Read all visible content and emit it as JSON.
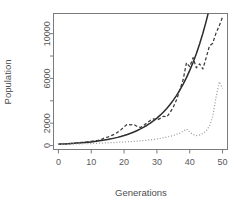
{
  "chart_data": {
    "type": "line",
    "title": "",
    "xlabel": "Generations",
    "ylabel": "Population",
    "xlim": [
      -1.5,
      51.5
    ],
    "ylim": [
      -350,
      11800
    ],
    "xticks": [
      0,
      10,
      20,
      30,
      40,
      50
    ],
    "xtick_labels": [
      "0",
      "10",
      "20",
      "30",
      "40",
      "50"
    ],
    "yticks": [
      0,
      2000,
      4000,
      6000,
      8000,
      10000
    ],
    "ytick_labels": [
      "0",
      "2000",
      "",
      "6000",
      "",
      "10000"
    ],
    "grid": false,
    "legend": "none",
    "box": true,
    "series": [
      {
        "name": "deterministic-exponential",
        "style": "solid",
        "color": "#2b2b2b",
        "x": [
          0,
          1,
          2,
          3,
          4,
          5,
          6,
          7,
          8,
          9,
          10,
          11,
          12,
          13,
          14,
          15,
          16,
          17,
          18,
          19,
          20,
          21,
          22,
          23,
          24,
          25,
          26,
          27,
          28,
          29,
          30,
          31,
          32,
          33,
          34,
          35,
          36,
          37,
          38,
          39,
          40,
          41,
          42,
          43,
          44,
          45,
          46,
          47,
          48,
          49,
          50,
          51
        ],
        "values": [
          120,
          133,
          147,
          163,
          180,
          199,
          220,
          243,
          269,
          297,
          329,
          364,
          402,
          445,
          492,
          544,
          601,
          665,
          735,
          813,
          899,
          994,
          1099,
          1215,
          1344,
          1486,
          1643,
          1817,
          2009,
          2222,
          2457,
          2717,
          3005,
          3322,
          3674,
          4062,
          4491,
          4967,
          5493,
          6074,
          6716,
          7426,
          8211,
          9079,
          10037,
          11097,
          12268,
          13563,
          14996,
          16580,
          18331,
          20268
        ]
      },
      {
        "name": "stochastic-run-a",
        "style": "dashed",
        "color": "#3a3a3a",
        "x": [
          0,
          1,
          2,
          3,
          4,
          5,
          6,
          7,
          8,
          9,
          10,
          11,
          12,
          13,
          14,
          15,
          16,
          17,
          18,
          19,
          20,
          21,
          22,
          23,
          24,
          25,
          26,
          27,
          28,
          29,
          30,
          31,
          32,
          33,
          34,
          35,
          36,
          37,
          38,
          39,
          40,
          41,
          42,
          43,
          44,
          45,
          46,
          47,
          48,
          49,
          50
        ],
        "values": [
          120,
          140,
          150,
          175,
          200,
          215,
          250,
          280,
          300,
          340,
          380,
          430,
          470,
          520,
          700,
          760,
          880,
          1000,
          1180,
          1400,
          1680,
          1900,
          1850,
          1880,
          1700,
          1620,
          1800,
          2050,
          2250,
          2380,
          2280,
          2430,
          2620,
          2560,
          2950,
          3450,
          4100,
          5000,
          5900,
          7400,
          7050,
          7850,
          6950,
          7300,
          6850,
          7850,
          8900,
          9150,
          10050,
          10700,
          11500
        ]
      },
      {
        "name": "stochastic-run-b",
        "style": "dotted",
        "color": "#9a9a9a",
        "x": [
          0,
          1,
          2,
          3,
          4,
          5,
          6,
          7,
          8,
          9,
          10,
          11,
          12,
          13,
          14,
          15,
          16,
          17,
          18,
          19,
          20,
          21,
          22,
          23,
          24,
          25,
          26,
          27,
          28,
          29,
          30,
          31,
          32,
          33,
          34,
          35,
          36,
          37,
          38,
          39,
          40,
          41,
          42,
          43,
          44,
          45,
          46,
          47,
          48,
          49,
          50
        ],
        "values": [
          110,
          115,
          120,
          130,
          135,
          145,
          150,
          160,
          165,
          175,
          185,
          195,
          205,
          215,
          230,
          245,
          255,
          270,
          290,
          305,
          320,
          340,
          355,
          375,
          400,
          420,
          450,
          480,
          510,
          545,
          590,
          640,
          700,
          760,
          830,
          905,
          1000,
          1120,
          1290,
          1480,
          1200,
          980,
          900,
          950,
          1080,
          1300,
          1750,
          2600,
          4300,
          5700,
          5100
        ]
      }
    ]
  },
  "axis": {
    "x_title": "Generations",
    "y_title": "Population"
  }
}
